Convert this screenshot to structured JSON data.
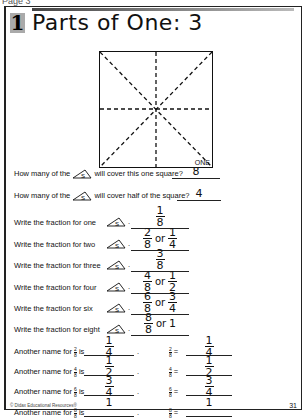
{
  "page_label": "Page 3",
  "lesson_number": "1",
  "title": "Parts of One: 3",
  "diagram": {
    "corner_label": "ONE",
    "piece_label": "S"
  },
  "questions": [
    {
      "text_before": "How many of the",
      "text_after": "will cover this one square?",
      "answer": "8"
    },
    {
      "text_before": "How many of the",
      "text_after": "will cover half of the square?",
      "answer": "4"
    }
  ],
  "write_fractions": [
    {
      "label": "Write the fraction for one",
      "answers": [
        {
          "n": "1",
          "d": "8"
        }
      ]
    },
    {
      "label": "Write the fraction for two",
      "answers": [
        {
          "n": "2",
          "d": "8"
        },
        {
          "n": "1",
          "d": "4"
        }
      ]
    },
    {
      "label": "Write the fraction for three",
      "answers": [
        {
          "n": "3",
          "d": "8"
        }
      ]
    },
    {
      "label": "Write the fraction for four",
      "answers": [
        {
          "n": "4",
          "d": "8"
        },
        {
          "n": "1",
          "d": "2"
        }
      ]
    },
    {
      "label": "Write the fraction for six",
      "answers": [
        {
          "n": "6",
          "d": "8"
        },
        {
          "n": "3",
          "d": "4"
        }
      ]
    },
    {
      "label": "Write the fraction for eight",
      "answers": [
        {
          "n": "8",
          "d": "8"
        },
        {
          "whole": "1"
        }
      ]
    }
  ],
  "or_word": "or",
  "another_names": [
    {
      "prefix": "Another name for",
      "n": "2",
      "d": "8",
      "is": "is",
      "ans": {
        "n": "1",
        "d": "4"
      }
    },
    {
      "prefix": "Another name for",
      "n": "4",
      "d": "8",
      "is": "is",
      "ans": {
        "n": "1",
        "d": "2"
      }
    },
    {
      "prefix": "Another name for",
      "n": "6",
      "d": "8",
      "is": "is",
      "ans": {
        "n": "3",
        "d": "4"
      }
    },
    {
      "prefix": "Another name for",
      "n": "8",
      "d": "8",
      "is": "is",
      "ans": {
        "whole": "1"
      }
    }
  ],
  "footer": "© Didax Educational Resources®",
  "page_number": "31"
}
